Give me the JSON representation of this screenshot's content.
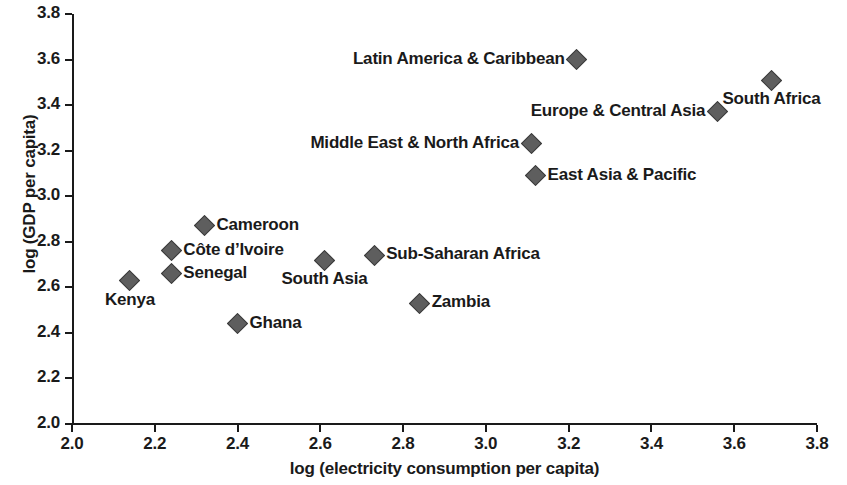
{
  "chart_data": {
    "type": "scatter",
    "title": "",
    "xlabel": "log (electricity consumption per capita)",
    "ylabel": "log (GDP per capita)",
    "xlim": [
      2.0,
      3.8
    ],
    "ylim": [
      2.0,
      3.8
    ],
    "xticks": [
      "2.0",
      "2.2",
      "2.4",
      "2.6",
      "2.8",
      "3.0",
      "3.2",
      "3.4",
      "3.6",
      "3.8"
    ],
    "yticks": [
      "2.0",
      "2.2",
      "2.4",
      "2.6",
      "2.8",
      "3.0",
      "3.2",
      "3.4",
      "3.6",
      "3.8"
    ],
    "grid": false,
    "legend": "none",
    "marker": {
      "shape": "diamond",
      "fill": "#5e5e5e",
      "edge": "#3a3a3a"
    },
    "points": [
      {
        "label": "Kenya",
        "x": 2.14,
        "y": 2.63,
        "label_pos": "below"
      },
      {
        "label": "Côte d’Ivoire",
        "x": 2.24,
        "y": 2.76,
        "label_pos": "right"
      },
      {
        "label": "Senegal",
        "x": 2.24,
        "y": 2.66,
        "label_pos": "right"
      },
      {
        "label": "Cameroon",
        "x": 2.32,
        "y": 2.87,
        "label_pos": "right"
      },
      {
        "label": "Ghana",
        "x": 2.4,
        "y": 2.44,
        "label_pos": "right"
      },
      {
        "label": "South Asia",
        "x": 2.61,
        "y": 2.72,
        "label_pos": "below"
      },
      {
        "label": "Sub-Saharan Africa",
        "x": 2.73,
        "y": 2.74,
        "label_pos": "right"
      },
      {
        "label": "Zambia",
        "x": 2.84,
        "y": 2.53,
        "label_pos": "right"
      },
      {
        "label": "East Asia & Pacific",
        "x": 3.12,
        "y": 3.09,
        "label_pos": "right"
      },
      {
        "label": "Middle East & North Africa",
        "x": 3.11,
        "y": 3.23,
        "label_pos": "left"
      },
      {
        "label": "Latin America & Caribbean",
        "x": 3.22,
        "y": 3.6,
        "label_pos": "left"
      },
      {
        "label": "Europe & Central Asia",
        "x": 3.56,
        "y": 3.37,
        "label_pos": "left"
      },
      {
        "label": "South Africa",
        "x": 3.69,
        "y": 3.51,
        "label_pos": "below"
      }
    ]
  }
}
